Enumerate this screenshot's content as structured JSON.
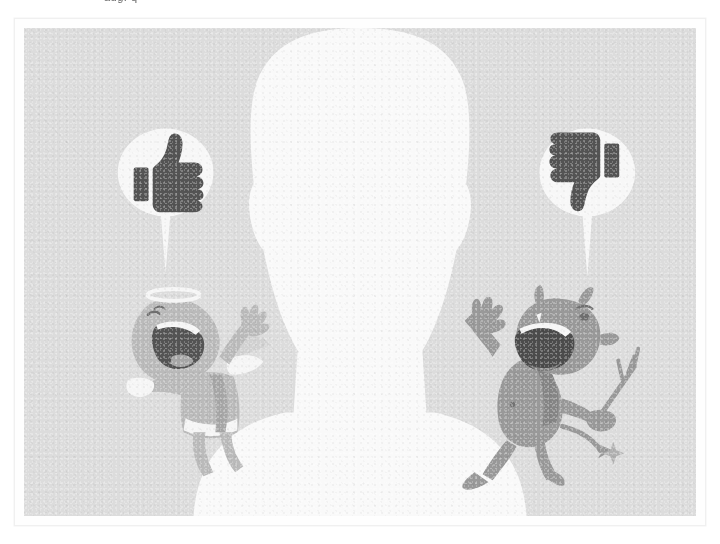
{
  "scene": {
    "title": "Angel and devil shouting opinions at a silhouetted head",
    "alt_text": "Grainy grey illustration: a white head-and-shoulders silhouette faces forward. A small winged angel on the left and a horned devil on the right both shout, each with a white speech bubble above containing a thumbs-up and a thumbs-down icon.",
    "background_color": "#dcdcdc",
    "silhouette_color": "#ffffff",
    "frame_color": "#fefefe",
    "page_background": "#ffffff"
  },
  "top_artifact": {
    "clipped_text": "aug. q",
    "note": "partially cropped text remnant at the very top edge"
  },
  "frame": {
    "name": "photo-frame",
    "border_color": "#f0f0f0",
    "padding_px": 9
  },
  "silhouette": {
    "name": "head-and-shoulders-silhouette",
    "label": "Undecided person",
    "fill": "#ffffff"
  },
  "bubbles": [
    {
      "id": "left",
      "name": "speech-bubble-approve",
      "icon": "thumbs-up-icon",
      "icon_label": "Thumbs up",
      "sentiment": "positive",
      "bubble_fill": "#fdfdfd",
      "icon_color": "#3a3a3a",
      "cx": 142,
      "cy": 145,
      "rx": 48,
      "ry": 44
    },
    {
      "id": "right",
      "name": "speech-bubble-disapprove",
      "icon": "thumbs-down-icon",
      "icon_label": "Thumbs down",
      "sentiment": "negative",
      "bubble_fill": "#fdfdfd",
      "icon_color": "#3a3a3a",
      "cx": 565,
      "cy": 145,
      "rx": 48,
      "ry": 44
    }
  ],
  "characters": [
    {
      "id": "angel",
      "name": "angel-character",
      "label": "Angel",
      "role": "Advocate of approval",
      "body_color": "#b4b4b4",
      "shade_color": "#9c9c9c",
      "highlight_color": "#fbfbfb",
      "mouth_color": "#3a3a3a",
      "features": [
        "halo",
        "wings",
        "open shouting mouth",
        "raised arm",
        "robe"
      ],
      "side": "left"
    },
    {
      "id": "devil",
      "name": "devil-character",
      "label": "Devil",
      "role": "Advocate of disapproval",
      "body_color": "#8c8c8c",
      "shade_color": "#757575",
      "highlight_color": "#fbfbfb",
      "mouth_color": "#303030",
      "features": [
        "horns",
        "pointed tail",
        "pitchfork",
        "open shouting mouth",
        "raised arm"
      ],
      "side": "right"
    }
  ]
}
